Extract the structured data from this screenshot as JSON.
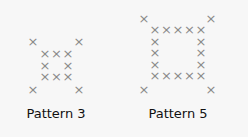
{
  "glyph": "×",
  "color": "#8a8a8a",
  "patterns": [
    {
      "label": "Pattern 3",
      "n": 3,
      "label_pos": [
        56,
        106
      ],
      "corners": [
        [
          33,
          42
        ],
        [
          79,
          42
        ],
        [
          33,
          90
        ],
        [
          79,
          90
        ]
      ],
      "inner": {
        "x0": 45,
        "y0": 54,
        "step": 11.5
      }
    },
    {
      "label": "Pattern 5",
      "n": 5,
      "label_pos": [
        178,
        106
      ],
      "corners": [
        [
          144,
          19
        ],
        [
          211,
          19
        ],
        [
          144,
          90
        ],
        [
          211,
          90
        ]
      ],
      "inner": {
        "x0": 155,
        "y0": 30,
        "step": 11.5
      }
    }
  ]
}
